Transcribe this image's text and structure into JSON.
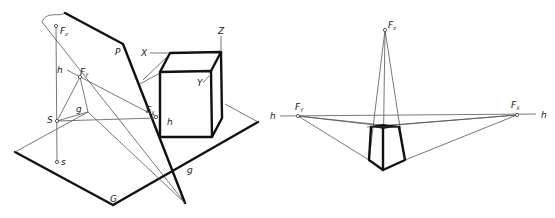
{
  "figure": {
    "left_panel": {
      "labels": {
        "Fz": "F",
        "Fz_sub": "z",
        "P": "P",
        "h": "h",
        "Fy": "F",
        "Fy_sub": "Y",
        "g_upper": "g",
        "S": "S",
        "s": "s",
        "Fx": "F",
        "Fx_sub": "X",
        "h_right": "h",
        "g": "g",
        "G": "G",
        "X": "X",
        "Y": "Y",
        "Z": "Z"
      }
    },
    "right_panel": {
      "labels": {
        "Fz": "F",
        "Fz_sub": "z",
        "Fy": "F",
        "Fy_sub": "Y",
        "Fx": "F",
        "Fx_sub": "X",
        "h_left": "h",
        "h_right": "h"
      }
    },
    "colors": {
      "line": "#111111",
      "construction": "#555555",
      "background": "#ffffff"
    }
  }
}
